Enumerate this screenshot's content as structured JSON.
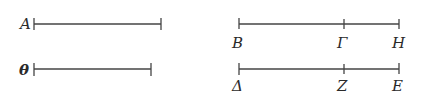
{
  "diagram": {
    "segments": [
      {
        "id": "A",
        "label": "A",
        "label_pos": "left",
        "x1": 34,
        "x2": 161,
        "y": 24,
        "ticks": [
          34,
          161
        ]
      },
      {
        "id": "Theta",
        "label": "θ",
        "label_pos": "left",
        "x1": 34,
        "x2": 151,
        "y": 69,
        "ticks": [
          34,
          151
        ]
      },
      {
        "id": "BH",
        "x1": 239,
        "x2": 399,
        "y": 24,
        "ticks": [
          239,
          344,
          399
        ],
        "points": [
          {
            "label": "B",
            "x": 239
          },
          {
            "label": "Γ",
            "x": 344
          },
          {
            "label": "H",
            "x": 399
          }
        ]
      },
      {
        "id": "DE",
        "x1": 239,
        "x2": 399,
        "y": 69,
        "ticks": [
          239,
          344,
          399
        ],
        "points": [
          {
            "label": "Δ",
            "x": 239
          },
          {
            "label": "Z",
            "x": 344
          },
          {
            "label": "E",
            "x": 399
          }
        ]
      }
    ]
  },
  "labels": {
    "A": "A",
    "Theta": "θ",
    "B": "B",
    "Gamma": "Γ",
    "H": "H",
    "Delta": "Δ",
    "Z": "Z",
    "E": "E"
  }
}
